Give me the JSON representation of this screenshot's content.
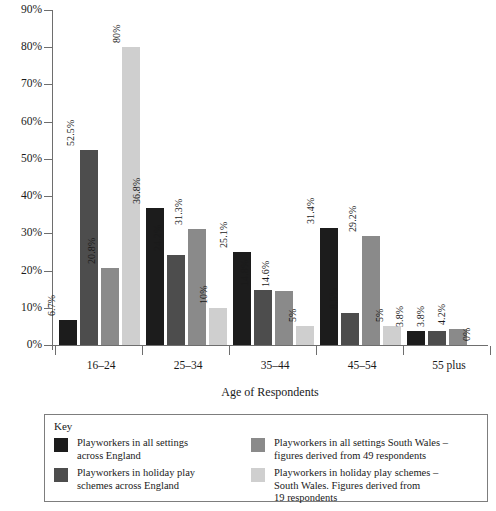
{
  "chart_data": {
    "type": "bar",
    "title": "",
    "xlabel": "Age of Respondents",
    "ylabel": "",
    "ylim": [
      0,
      90
    ],
    "grid": false,
    "legend_position": "bottom",
    "categories": [
      "16–24",
      "25–34",
      "35–44",
      "45–54",
      "55 plus"
    ],
    "y_ticks": [
      "0%",
      "10%",
      "20%",
      "30%",
      "40%",
      "50%",
      "60%",
      "70%",
      "80%",
      "90%"
    ],
    "series": [
      {
        "name": "Playworkers in all settings across England",
        "color": "#1c1c1c",
        "values": [
          6.7,
          36.8,
          25.1,
          31.4,
          3.8
        ],
        "labels": [
          "6.7%",
          "36.8%",
          "25.1%",
          "31.4%",
          "3.8%"
        ]
      },
      {
        "name": "Playworkers in holiday play schemes across England",
        "color": "#4d4d4d",
        "values": [
          52.5,
          24.2,
          14.8,
          8.5,
          3.8
        ],
        "labels": [
          "52.5%",
          "24.2%",
          "14.8%",
          "8.5%",
          "3.8%"
        ]
      },
      {
        "name": "Playworkers in all settings South Wales – figures derived from 49 respondents",
        "color": "#8a8a8a",
        "values": [
          20.8,
          31.3,
          14.6,
          29.2,
          4.2
        ],
        "labels": [
          "20.8%",
          "31.3%",
          "14.6%",
          "29.2%",
          "4.2%"
        ]
      },
      {
        "name": "Playworkers in holiday play schemes – South Wales. Figures derived from 19 respondents",
        "color": "#cfcfcf",
        "values": [
          80,
          10,
          5,
          5,
          0
        ],
        "labels": [
          "80%",
          "10%",
          "5%",
          "5%",
          "0%"
        ]
      }
    ]
  },
  "legend": {
    "title": "Key",
    "items": [
      {
        "color": "#1c1c1c",
        "text": "Playworkers in all settings\nacross England"
      },
      {
        "color": "#4d4d4d",
        "text": "Playworkers in holiday play\nschemes across England"
      },
      {
        "color": "#8a8a8a",
        "text": "Playworkers in all settings South Wales –\nfigures derived from 49 respondents"
      },
      {
        "color": "#cfcfcf",
        "text": "Playworkers in holiday play schemes –\nSouth Wales. Figures derived from\n19 respondents"
      }
    ]
  }
}
